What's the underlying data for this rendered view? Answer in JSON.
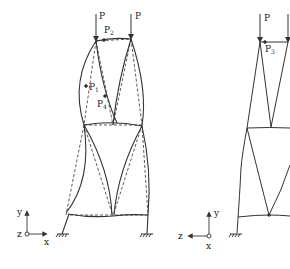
{
  "figure": {
    "left": {
      "loads": [
        "P",
        "P"
      ],
      "labels": {
        "p2": "P",
        "p2_sub": "2",
        "p1": "P",
        "p1_sub": "1",
        "p4": "P",
        "p4_sub": "4"
      },
      "axes": {
        "y": "y",
        "z": "z",
        "x": "x"
      }
    },
    "right": {
      "loads": [
        "P"
      ],
      "labels": {
        "p3": "P",
        "p3_sub": "3"
      },
      "axes": {
        "y": "y",
        "z": "z",
        "x": "x"
      }
    },
    "colors": {
      "line": "#333333",
      "background": "#ffffff"
    }
  }
}
